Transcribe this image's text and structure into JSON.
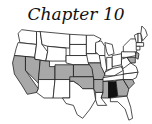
{
  "header": {
    "title": "Chapter 10"
  },
  "map": {
    "colors": {
      "none": "#ffffff",
      "light": "#a8a8a8",
      "dark": "#111111",
      "stroke": "#111111"
    },
    "states": [
      {
        "id": "WA",
        "fill": "none",
        "points": "14,4 30,6 30,20 12,18 10,8"
      },
      {
        "id": "OR",
        "fill": "none",
        "points": "10,18 30,20 28,34 6,32 8,24"
      },
      {
        "id": "CA",
        "fill": "light",
        "points": "6,32 18,33 18,48 32,68 30,72 20,74 14,64 6,52 4,40"
      },
      {
        "id": "ID",
        "fill": "none",
        "points": "30,6 34,6 36,20 42,28 40,38 28,36 28,34 30,20"
      },
      {
        "id": "NV",
        "fill": "light",
        "points": "18,33 28,34 28,36 34,37 32,62 18,48"
      },
      {
        "id": "MT",
        "fill": "none",
        "points": "34,6 66,9 66,24 42,22 36,20"
      },
      {
        "id": "WY",
        "fill": "none",
        "points": "42,22 62,24 62,38 40,38 42,28"
      },
      {
        "id": "UT",
        "fill": "light",
        "points": "34,37 40,38 44,38 44,44 50,44 50,58 32,58"
      },
      {
        "id": "CO",
        "fill": "light",
        "points": "50,42 70,42 70,58 50,58"
      },
      {
        "id": "AZ",
        "fill": "none",
        "points": "32,58 50,58 48,78 38,78 30,72 32,68"
      },
      {
        "id": "NM",
        "fill": "none",
        "points": "50,58 66,58 66,78 48,78"
      },
      {
        "id": "ND",
        "fill": "none",
        "points": "66,9 84,10 84,20 66,20"
      },
      {
        "id": "SD",
        "fill": "none",
        "points": "66,20 84,20 84,32 66,32"
      },
      {
        "id": "NE",
        "fill": "none",
        "points": "62,32 86,32 88,42 70,42 62,40"
      },
      {
        "id": "KS",
        "fill": "light",
        "points": "70,42 90,42 92,55 70,55"
      },
      {
        "id": "OK",
        "fill": "light",
        "points": "66,55 92,55 92,68 80,68 76,64 70,60 66,60"
      },
      {
        "id": "TX",
        "fill": "none",
        "points": "66,60 70,60 76,64 80,68 92,68 94,80 88,90 80,100 74,96 70,86 62,84 58,78 66,78"
      },
      {
        "id": "MN",
        "fill": "none",
        "points": "84,10 92,10 100,14 94,20 94,30 84,30"
      },
      {
        "id": "IA",
        "fill": "none",
        "points": "84,30 98,30 100,40 86,40"
      },
      {
        "id": "MO",
        "fill": "light",
        "points": "86,40 100,40 104,52 102,58 92,58 90,46"
      },
      {
        "id": "AR",
        "fill": "light",
        "points": "92,58 104,58 102,72 94,72 92,68"
      },
      {
        "id": "LA",
        "fill": "none",
        "points": "94,72 102,72 100,78 106,86 96,86 94,80"
      },
      {
        "id": "WI",
        "fill": "none",
        "points": "94,18 100,16 104,22 104,32 98,32 94,28"
      },
      {
        "id": "IL",
        "fill": "none",
        "points": "98,32 104,32 106,46 104,52 100,44"
      },
      {
        "id": "MI",
        "fill": "none",
        "points": "104,18 112,20 114,30 108,32 106,28"
      },
      {
        "id": "IN",
        "fill": "none",
        "points": "106,34 112,34 112,46 106,48"
      },
      {
        "id": "OH",
        "fill": "none",
        "points": "112,32 122,30 122,42 112,44"
      },
      {
        "id": "KY",
        "fill": "none",
        "points": "104,50 112,46 122,44 124,48 114,54 104,54"
      },
      {
        "id": "TN",
        "fill": "none",
        "points": "102,56 126,52 124,58 102,60"
      },
      {
        "id": "MS",
        "fill": "light",
        "points": "102,60 108,60 108,78 100,78 102,72"
      },
      {
        "id": "AL",
        "fill": "dark",
        "points": "108,60 116,60 118,76 110,78 108,78"
      },
      {
        "id": "GA",
        "fill": "light",
        "points": "116,59 124,58 130,68 128,76 118,76"
      },
      {
        "id": "SC",
        "fill": "light",
        "points": "124,58 134,58 136,62 130,68"
      },
      {
        "id": "FL",
        "fill": "none",
        "points": "110,78 128,76 132,88 134,100 130,102 126,90 118,82 110,82"
      },
      {
        "id": "NC",
        "fill": "none",
        "points": "124,52 140,50 138,56 134,58 124,58"
      },
      {
        "id": "VA",
        "fill": "none",
        "points": "122,44 132,40 138,44 140,50 124,52 124,48"
      },
      {
        "id": "WV",
        "fill": "none",
        "points": "122,36 128,34 132,40 124,46 122,42"
      },
      {
        "id": "PA",
        "fill": "none",
        "points": "122,28 136,26 138,32 128,34 122,34"
      },
      {
        "id": "NY",
        "fill": "none",
        "points": "124,22 132,14 138,14 140,24 138,28 124,28"
      },
      {
        "id": "NJ",
        "fill": "light",
        "points": "138,28 141,30 140,36 137,34"
      },
      {
        "id": "MD",
        "fill": "light",
        "points": "128,34 137,34 137,40 132,40"
      },
      {
        "id": "VT",
        "fill": "none",
        "points": "136,10 140,8 140,18 138,18"
      },
      {
        "id": "NH",
        "fill": "none",
        "points": "140,8 143,8 144,18 140,18"
      },
      {
        "id": "ME",
        "fill": "none",
        "points": "143,8 144,0 148,4 150,10 145,16"
      },
      {
        "id": "MA",
        "fill": "none",
        "points": "138,18 146,18 146,22 138,22"
      },
      {
        "id": "CT",
        "fill": "none",
        "points": "138,22 142,22 142,26 138,26"
      }
    ]
  }
}
